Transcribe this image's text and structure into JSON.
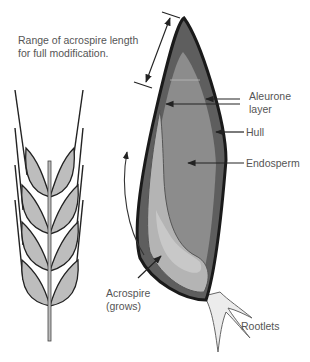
{
  "labels": {
    "range": {
      "line1": "Range of acrospire length",
      "line2": "for full modification."
    },
    "aleurone": {
      "line1": "Aleurone",
      "line2": "layer"
    },
    "hull": "Hull",
    "endosperm": "Endosperm",
    "acrospire": {
      "line1": "Acrospire",
      "line2": "(grows)"
    },
    "rootlets": "Rootlets"
  },
  "colors": {
    "hull_outline": "#1a1a1a",
    "aleurone_band": "#5e5e5e",
    "endosperm_fill": "#8c8c8c",
    "acrospire_fill": "#b4b4b4",
    "acrospire_inner": "#c8c8c8",
    "wheat_fill": "#bdbdbd",
    "rootlets_fill": "#ececec",
    "label_text": "#555555"
  }
}
